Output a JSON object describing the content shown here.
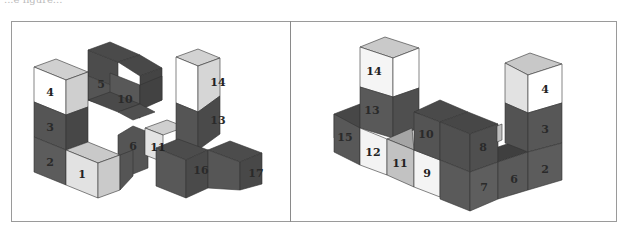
{
  "caption_fragment": "...e figure...",
  "colors": {
    "dark_top": "#4a4a4a",
    "dark_front": "#5a5a5a",
    "dark_side": "#444444",
    "light_top": "#c8c8c8",
    "light_front": "#f4f4f4",
    "mid_front": "#c4c4c4",
    "white": "#ffffff",
    "edge": "#333333",
    "frame": "#9a9a9a"
  },
  "panels": [
    {
      "name": "left-view",
      "labels": {
        "c4": "4",
        "c3": "3",
        "c2": "2",
        "c1": "1",
        "c5": "5",
        "c10": "10",
        "c6": "6",
        "c11": "11",
        "c14": "14",
        "c13": "13",
        "c16": "16",
        "c17": "17"
      }
    },
    {
      "name": "right-view",
      "labels": {
        "c14": "14",
        "c13": "13",
        "c15": "15",
        "c12": "12",
        "c11": "11",
        "c10": "10",
        "c9": "9",
        "c8": "8",
        "c7": "7",
        "c6": "6",
        "c2": "2",
        "c3": "3",
        "c4": "4"
      }
    }
  ]
}
